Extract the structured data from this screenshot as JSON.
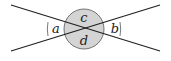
{
  "diagram": {
    "labels": {
      "a": "a",
      "b": "b",
      "c": "c",
      "d": "d"
    },
    "colors": {
      "line": "#222222",
      "circle_fill": "#d4d4d4",
      "circle_stroke": "#555555",
      "background": "#ffffff"
    }
  }
}
